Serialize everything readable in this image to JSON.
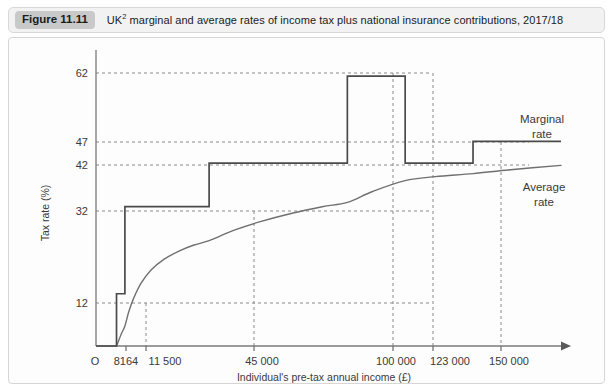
{
  "figure": {
    "badge": "Figure 11.11",
    "caption_pre": "UK",
    "caption_sup": "2",
    "caption_post": " marginal and average rates of income tax plus national insurance contributions, 2017/18"
  },
  "chart_data": {
    "type": "line",
    "title": "UK2 marginal and average rates of income tax plus national insurance contributions, 2017/18",
    "xlabel": "Individual's pre-tax annual income (£)",
    "ylabel": "Tax rate (%)",
    "origin_label": "O",
    "xlim": [
      0,
      185000
    ],
    "ylim": [
      0,
      68
    ],
    "grid": "dotted-at-ticks",
    "legend_position": "inline-right",
    "x_ticks": [
      8164,
      11500,
      45000,
      100000,
      123000,
      150000
    ],
    "x_tick_labels": [
      "8164",
      "11 500",
      "45 000",
      "100 000",
      "123 000",
      "150 000"
    ],
    "y_ticks": [
      12,
      32,
      42,
      47,
      62
    ],
    "y_tick_labels": [
      "12",
      "32",
      "42",
      "47",
      "62"
    ],
    "series": [
      {
        "name": "Marginal rate",
        "label": "Marginal\nrate",
        "label_line1": "Marginal",
        "label_line2": "rate",
        "type": "step",
        "color": "#4a4a4a",
        "points": [
          {
            "x": 0,
            "y": 0
          },
          {
            "x": 8164,
            "y": 0
          },
          {
            "x": 8164,
            "y": 12
          },
          {
            "x": 11500,
            "y": 12
          },
          {
            "x": 11500,
            "y": 32
          },
          {
            "x": 45000,
            "y": 32
          },
          {
            "x": 45000,
            "y": 42
          },
          {
            "x": 100000,
            "y": 42
          },
          {
            "x": 100000,
            "y": 62
          },
          {
            "x": 123000,
            "y": 62
          },
          {
            "x": 123000,
            "y": 42
          },
          {
            "x": 150000,
            "y": 42
          },
          {
            "x": 150000,
            "y": 47
          },
          {
            "x": 185000,
            "y": 47
          }
        ]
      },
      {
        "name": "Average rate",
        "label": "Average\nrate",
        "label_line1": "Average",
        "label_line2": "rate",
        "type": "curve",
        "color": "#707070",
        "points": [
          {
            "x": 8164,
            "y": 0
          },
          {
            "x": 9000,
            "y": 1.2
          },
          {
            "x": 10000,
            "y": 2.7
          },
          {
            "x": 11500,
            "y": 4.6
          },
          {
            "x": 13000,
            "y": 7.8
          },
          {
            "x": 15000,
            "y": 11.0
          },
          {
            "x": 18000,
            "y": 14.5
          },
          {
            "x": 22000,
            "y": 17.5
          },
          {
            "x": 27000,
            "y": 19.9
          },
          {
            "x": 33000,
            "y": 21.8
          },
          {
            "x": 39000,
            "y": 23.2
          },
          {
            "x": 45000,
            "y": 24.2
          },
          {
            "x": 55000,
            "y": 26.6
          },
          {
            "x": 65000,
            "y": 28.5
          },
          {
            "x": 78000,
            "y": 30.5
          },
          {
            "x": 90000,
            "y": 32.0
          },
          {
            "x": 100000,
            "y": 33.0
          },
          {
            "x": 110000,
            "y": 35.5
          },
          {
            "x": 123000,
            "y": 38.0
          },
          {
            "x": 135000,
            "y": 38.9
          },
          {
            "x": 150000,
            "y": 39.6
          },
          {
            "x": 165000,
            "y": 40.5
          },
          {
            "x": 185000,
            "y": 41.5
          }
        ]
      }
    ]
  }
}
